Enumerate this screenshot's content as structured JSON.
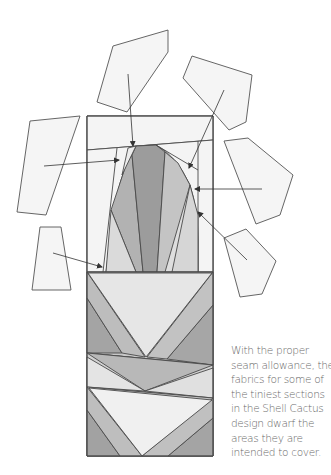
{
  "figure": {
    "type": "quilt-pattern-diagram",
    "colors": {
      "background": "#ffffff",
      "outline": "#4a4a4a",
      "piece_fill": "#f4f4f4",
      "lightest": "#f0f0f0",
      "light": "#dcdcdc",
      "mid_light": "#c8c8c8",
      "mid": "#b4b4b4",
      "dark": "#9a9a9a",
      "text": "#6a6a6a"
    },
    "floating_pieces_count": 6,
    "arrows_count": 6
  },
  "caption": {
    "lines": [
      "With the proper",
      "seam allowance, the",
      "fabrics for some of",
      "the tiniest sections",
      "in the Shell Cactus",
      "design dwarf the",
      "areas they are",
      "intended to cover."
    ]
  }
}
